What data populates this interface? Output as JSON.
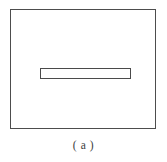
{
  "figure": {
    "background_color": "#ffffff",
    "caption": "( a )",
    "caption_label": "a",
    "outer_rect": {
      "name": "outer-boundary-rectangle",
      "stroke_color": "#4d4d4d",
      "fill_color": "#ffffff",
      "x": 10,
      "y": 9,
      "width": 146,
      "height": 120,
      "stroke_width": 1.4
    },
    "inner_bar": {
      "name": "inner-horizontal-bar",
      "stroke_color": "#4a4a4a",
      "fill_color": "#fefefe",
      "x": 40,
      "y": 68,
      "width": 91,
      "height": 11,
      "stroke_width": 1.3
    }
  }
}
